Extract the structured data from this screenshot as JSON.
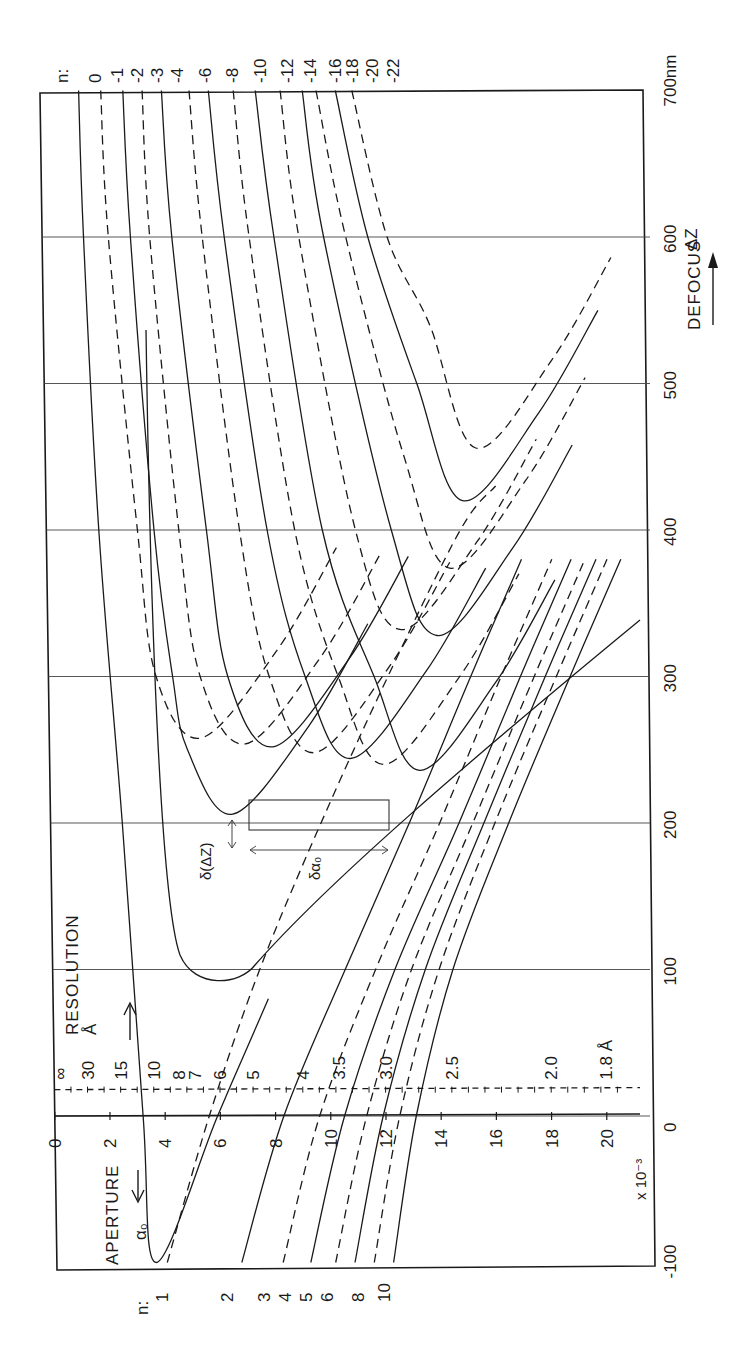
{
  "chart_data": {
    "type": "line",
    "orientation_note_visible": "figure printed rotated 90 degrees",
    "xlabel": "DEFOCUS ΔZ",
    "x_unit": "nm",
    "x_ticks": [
      "-100",
      "0",
      "100",
      "200",
      "300",
      "400",
      "500",
      "600",
      "700nm"
    ],
    "x_tick_values": [
      -100,
      0,
      100,
      200,
      300,
      400,
      500,
      600,
      700
    ],
    "xlim": [
      -100,
      700
    ],
    "ylabel": "APERTURE α₀",
    "y_scale_label": "x 10⁻³",
    "y_ticks": [
      "0",
      "2",
      "4",
      "6",
      "8",
      "10",
      "12",
      "14",
      "16",
      "18",
      "20"
    ],
    "y_tick_values": [
      0,
      2,
      4,
      6,
      8,
      10,
      12,
      14,
      16,
      18,
      20
    ],
    "ylim": [
      0,
      21
    ],
    "secondary_axis": {
      "label": "RESOLUTION",
      "unit": "Å",
      "ticks": [
        "∞",
        "30",
        "15",
        "10",
        "8",
        "7",
        "6",
        "5",
        "4",
        "3.5",
        "3.0",
        "2.5",
        "2.0",
        "1.8 Å"
      ],
      "tick_aperture_positions": [
        0,
        1.2,
        2.4,
        3.6,
        4.5,
        5.1,
        6.0,
        7.2,
        9.0,
        10.3,
        12.0,
        14.4,
        18.0,
        20.0
      ]
    },
    "grid": true,
    "series_label_prefix": "n:",
    "series": [
      {
        "name": "0",
        "style": "solid",
        "points": [
          [
            700,
            1.4
          ],
          [
            600,
            1.5
          ],
          [
            400,
            1.9
          ],
          [
            200,
            2.6
          ],
          [
            0,
            3.2
          ],
          [
            -100,
            3.6
          ]
        ]
      },
      {
        "name": "-1",
        "style": "dashed",
        "points": [
          [
            700,
            2.2
          ],
          [
            600,
            2.4
          ],
          [
            400,
            3.3
          ],
          [
            300,
            3.9
          ]
        ]
      },
      {
        "name": "-2",
        "style": "solid",
        "points": [
          [
            700,
            3.0
          ],
          [
            600,
            3.2
          ],
          [
            400,
            3.9
          ],
          [
            300,
            4.5
          ],
          [
            250,
            5.0
          ]
        ]
      },
      {
        "name": "-3",
        "style": "dashed",
        "points": [
          [
            700,
            3.7
          ],
          [
            600,
            3.9
          ],
          [
            400,
            4.8
          ],
          [
            300,
            5.5
          ]
        ]
      },
      {
        "name": "-4",
        "style": "solid",
        "points": [
          [
            700,
            4.4
          ],
          [
            600,
            4.7
          ],
          [
            400,
            5.8
          ],
          [
            300,
            6.5
          ]
        ]
      },
      {
        "name": "-6",
        "style": "dashed",
        "points": [
          [
            700,
            5.4
          ],
          [
            600,
            5.8
          ],
          [
            400,
            7.0
          ],
          [
            300,
            8.0
          ]
        ]
      },
      {
        "name": "-8",
        "style": "solid",
        "points": [
          [
            700,
            6.1
          ],
          [
            600,
            6.6
          ],
          [
            400,
            8.0
          ],
          [
            300,
            9.3
          ]
        ]
      },
      {
        "name": "-10",
        "style": "dashed",
        "points": [
          [
            700,
            7.0
          ],
          [
            600,
            7.5
          ],
          [
            400,
            9.0
          ],
          [
            300,
            10.5
          ]
        ]
      },
      {
        "name": "-12",
        "style": "solid",
        "points": [
          [
            700,
            7.8
          ],
          [
            600,
            8.4
          ],
          [
            400,
            10.0
          ],
          [
            300,
            11.8
          ]
        ]
      },
      {
        "name": "-14",
        "style": "dashed",
        "points": [
          [
            700,
            8.7
          ],
          [
            600,
            9.3
          ],
          [
            400,
            11.2
          ]
        ]
      },
      {
        "name": "-16",
        "style": "solid",
        "points": [
          [
            700,
            9.5
          ],
          [
            600,
            10.2
          ],
          [
            400,
            12.5
          ]
        ]
      },
      {
        "name": "-18",
        "style": "dashed",
        "points": [
          [
            700,
            10.0
          ],
          [
            600,
            11.0
          ],
          [
            450,
            13.0
          ]
        ]
      },
      {
        "name": "-20",
        "style": "solid",
        "points": [
          [
            700,
            10.7
          ],
          [
            600,
            11.8
          ],
          [
            500,
            13.5
          ]
        ]
      },
      {
        "name": "-22",
        "style": "dashed",
        "points": [
          [
            700,
            11.3
          ],
          [
            600,
            12.5
          ],
          [
            540,
            14.0
          ]
        ]
      },
      {
        "name": "1",
        "style": "dashed",
        "points": [
          [
            -100,
            4.0
          ],
          [
            0,
            5.6
          ],
          [
            100,
            7.5
          ],
          [
            200,
            9.8
          ]
        ]
      },
      {
        "name": "2",
        "style": "solid",
        "points": [
          [
            -100,
            6.7
          ],
          [
            0,
            8.3
          ],
          [
            100,
            10.6
          ],
          [
            200,
            13.0
          ]
        ]
      },
      {
        "name": "3",
        "style": "dashed",
        "points": [
          [
            -100,
            8.2
          ],
          [
            0,
            9.6
          ],
          [
            100,
            11.7
          ],
          [
            200,
            14.1
          ]
        ]
      },
      {
        "name": "4",
        "style": "solid",
        "points": [
          [
            -100,
            9.2
          ],
          [
            0,
            10.5
          ],
          [
            100,
            12.4
          ],
          [
            200,
            14.8
          ]
        ]
      },
      {
        "name": "5",
        "style": "dashed",
        "points": [
          [
            -100,
            10.1
          ],
          [
            0,
            11.3
          ],
          [
            100,
            13.0
          ],
          [
            200,
            15.3
          ]
        ]
      },
      {
        "name": "6",
        "style": "solid",
        "points": [
          [
            -100,
            10.8
          ],
          [
            0,
            11.9
          ],
          [
            100,
            13.5
          ],
          [
            200,
            15.7
          ]
        ]
      },
      {
        "name": "8",
        "style": "dashed",
        "points": [
          [
            -100,
            11.5
          ],
          [
            0,
            12.5
          ],
          [
            100,
            14.0
          ],
          [
            200,
            16.1
          ]
        ]
      },
      {
        "name": "10",
        "style": "solid",
        "points": [
          [
            -100,
            12.2
          ],
          [
            0,
            13.1
          ],
          [
            100,
            14.5
          ],
          [
            200,
            16.6
          ]
        ]
      }
    ],
    "annotations": [
      "δ(ΔZ)",
      "δα₀"
    ],
    "arrows": [
      "RESOLUTION arrow pointing to lower resolution",
      "APERTURE arrow",
      "DEFOCUS ΔZ arrow"
    ]
  },
  "labels": {
    "n_prefix_top": "n:",
    "n_prefix_bottom": "n:",
    "top_n": [
      "0",
      "-1",
      "-2",
      "-3",
      "-4",
      "-6",
      "-8",
      "-10",
      "-12",
      "-14",
      "-16",
      "-18",
      "-20",
      "-22"
    ],
    "bottom_n": [
      "1",
      "2",
      "3",
      "4",
      "5",
      "6",
      "8",
      "10"
    ],
    "defocus_title": "DEFOCUS",
    "defocus_symbol": "ΔZ",
    "defocus_ticks": [
      "-100",
      "0",
      "100",
      "200",
      "300",
      "400",
      "500",
      "600",
      "700nm"
    ],
    "aperture_title": "APERTURE",
    "aperture_symbol": "α₀",
    "aperture_ticks": [
      "0",
      "2",
      "4",
      "6",
      "8",
      "10",
      "12",
      "14",
      "16",
      "18",
      "20"
    ],
    "aperture_scale": "x 10⁻³",
    "resolution_title": "RESOLUTION",
    "resolution_unit": "Å",
    "resolution_ticks": [
      "∞",
      "30",
      "15",
      "10",
      "8",
      "7",
      "6",
      "5",
      "4",
      "3.5",
      "3.0",
      "2.5",
      "2.0",
      "1.8 Å"
    ],
    "annot_dz": "δ(ΔZ)",
    "annot_da": "δα₀"
  }
}
